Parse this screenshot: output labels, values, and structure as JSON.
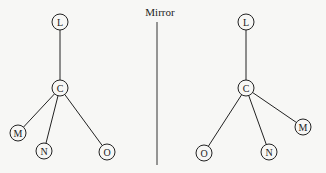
{
  "title": "Mirror",
  "mirror_line": {
    "x": 157,
    "y1": 22,
    "y2": 165
  },
  "trees": [
    {
      "name": "original",
      "nodes": [
        {
          "id": "L",
          "label": "L",
          "x": 60,
          "y": 22
        },
        {
          "id": "C",
          "label": "C",
          "x": 60,
          "y": 88
        },
        {
          "id": "M",
          "label": "M",
          "x": 18,
          "y": 133
        },
        {
          "id": "N",
          "label": "N",
          "x": 44,
          "y": 151
        },
        {
          "id": "O",
          "label": "O",
          "x": 107,
          "y": 152
        }
      ],
      "edges": [
        [
          "L",
          "C"
        ],
        [
          "C",
          "M"
        ],
        [
          "C",
          "N"
        ],
        [
          "C",
          "O"
        ]
      ]
    },
    {
      "name": "mirror-image",
      "nodes": [
        {
          "id": "L",
          "label": "L",
          "x": 246,
          "y": 22
        },
        {
          "id": "C",
          "label": "C",
          "x": 246,
          "y": 88
        },
        {
          "id": "M",
          "label": "M",
          "x": 303,
          "y": 127
        },
        {
          "id": "N",
          "label": "N",
          "x": 269,
          "y": 152
        },
        {
          "id": "O",
          "label": "O",
          "x": 204,
          "y": 153
        }
      ],
      "edges": [
        [
          "L",
          "C"
        ],
        [
          "C",
          "M"
        ],
        [
          "C",
          "N"
        ],
        [
          "C",
          "O"
        ]
      ]
    }
  ],
  "node_radius": 8
}
